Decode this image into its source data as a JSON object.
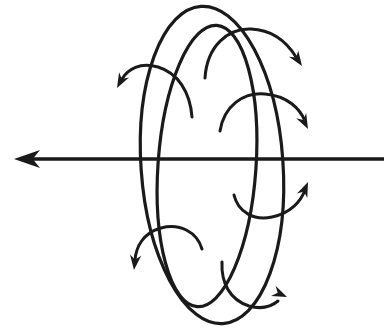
{
  "figure": {
    "title": "Torus with rotation axis and circulating field arrows",
    "caption": "",
    "background_color": "#ffffff",
    "ink_color": "#1a1a1a",
    "width": 384,
    "height": 335
  },
  "axis": {
    "name": "horizontal-axis-arrow",
    "label": "",
    "direction": "left",
    "y": 159,
    "x_start": 384,
    "x_end": 14,
    "stroke_width": 3.4,
    "arrowhead": {
      "tip_x": 14,
      "tip_y": 159,
      "length": 26,
      "half_width": 9
    }
  },
  "torus": {
    "name": "torus-outline",
    "stroke_width": 3.2,
    "outer_ellipse": {
      "label": "outer-tube-edge",
      "cx": 212,
      "cy": 165,
      "rx": 71,
      "ry": 159,
      "rotation_deg": -4
    },
    "inner_ellipse": {
      "label": "inner-tube-edge",
      "cx": 207,
      "cy": 166,
      "rx": 49,
      "ry": 141,
      "rotation_deg": 4
    }
  },
  "circulation_arrows": [
    {
      "id": "arrow-top-right",
      "name": "circulation-arrow-top-right",
      "label": "",
      "direction": "right-down",
      "path": "M 205 78 C 207 46 228 28 251 29 C 275 30 288 44 296 57",
      "head": {
        "tip_x": 302,
        "tip_y": 66,
        "angle_deg": 56
      },
      "stroke_width": 3.0
    },
    {
      "id": "arrow-upper-left",
      "name": "circulation-arrow-upper-left",
      "label": "",
      "direction": "left-down",
      "path": "M 192 117 C 190 92 178 73 158 67 C 140 62 128 69 122 79",
      "head": {
        "tip_x": 117,
        "tip_y": 88,
        "angle_deg": 118
      },
      "stroke_width": 3.0
    },
    {
      "id": "arrow-mid-right",
      "name": "circulation-arrow-mid-right",
      "label": "",
      "direction": "right-down",
      "path": "M 220 131 C 224 106 243 92 265 94 C 288 96 300 109 305 121",
      "head": {
        "tip_x": 308,
        "tip_y": 129,
        "angle_deg": 63
      },
      "stroke_width": 3.0
    },
    {
      "id": "arrow-right-below-axis",
      "name": "circulation-arrow-right-below-axis",
      "label": "",
      "direction": "right-up",
      "path": "M 234 195 C 238 212 254 221 272 217 C 291 213 301 201 305 190",
      "head": {
        "tip_x": 308,
        "tip_y": 182,
        "angle_deg": -67
      },
      "stroke_width": 3.0
    },
    {
      "id": "arrow-lower-left",
      "name": "circulation-arrow-lower-left",
      "label": "",
      "direction": "left-down",
      "path": "M 202 249 C 197 232 180 223 161 228 C 143 233 136 247 135 260",
      "head": {
        "tip_x": 134,
        "tip_y": 270,
        "angle_deg": 96
      },
      "stroke_width": 3.0
    },
    {
      "id": "arrow-bottom-right",
      "name": "circulation-arrow-bottom-right",
      "label": "",
      "direction": "right",
      "path": "M 222 262 C 221 283 230 300 249 306 C 263 310 272 306 278 301",
      "head": {
        "tip_x": 287,
        "tip_y": 297,
        "angle_deg": 24
      },
      "stroke_width": 3.0
    }
  ]
}
